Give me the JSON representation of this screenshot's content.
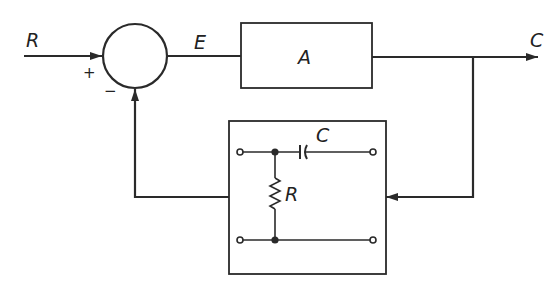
{
  "diagram": {
    "type": "feedback-control-block-diagram",
    "input_label": "R",
    "output_label": "C",
    "error_label": "E",
    "plus_sign": "+",
    "minus_sign": "−",
    "forward_block": {
      "label": "A"
    },
    "feedback_network": {
      "capacitor_label": "C",
      "resistor_label": "R"
    },
    "colors": {
      "stroke": "#2a2a2a",
      "background": "#ffffff"
    }
  }
}
